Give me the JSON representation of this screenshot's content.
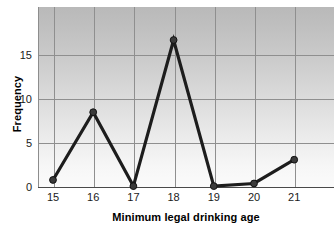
{
  "chart_data": {
    "type": "line",
    "title": "",
    "xlabel": "Minimum legal drinking age",
    "ylabel": "Frequency",
    "x": [
      15,
      16,
      17,
      18,
      19,
      20,
      21
    ],
    "values": [
      0.8,
      8.5,
      0.1,
      16.7,
      0.1,
      0.4,
      3.1
    ],
    "xtick_labels": [
      "15",
      "16",
      "17",
      "18",
      "19",
      "20",
      "21"
    ],
    "ytick_labels": [
      "0",
      "5",
      "10",
      "15"
    ],
    "ytick_values": [
      0,
      5,
      10,
      15
    ],
    "xlim": [
      14.5,
      21.5
    ],
    "ylim": [
      0,
      19
    ],
    "grid": true,
    "legend": "none",
    "marker": "circle",
    "line_color": "#1d1d1d",
    "marker_color": "#3a3a3a",
    "grid_color": "#8f8f8f",
    "plot_background": "#cccccc"
  },
  "axis": {
    "y_title": "Frequency",
    "x_title": "Minimum legal drinking age"
  }
}
